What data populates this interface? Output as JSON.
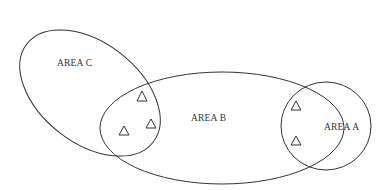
{
  "diagram": {
    "type": "venn",
    "areas": [
      {
        "id": "A",
        "label": "AREA A"
      },
      {
        "id": "B",
        "label": "AREA B"
      },
      {
        "id": "C",
        "label": "AREA C"
      }
    ],
    "markers": {
      "shape": "triangle",
      "in_B_and_C": 3,
      "in_A_and_B": 2
    },
    "colors": {
      "stroke": "#333333",
      "background": "#ffffff"
    }
  }
}
